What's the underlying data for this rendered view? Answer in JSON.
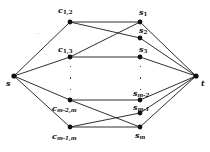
{
  "figure": {
    "background_color": "#ffffff",
    "edge_color": "#1a1a1a",
    "node_color": "#101010",
    "width": 210,
    "height": 152
  },
  "terminals": {
    "source": {
      "label": "s",
      "x": 14,
      "y": 76
    },
    "sink": {
      "label": "t",
      "x": 196,
      "y": 76
    }
  },
  "left_column": {
    "name": "clause-nodes",
    "nodes": [
      {
        "id": "c12",
        "base": "c",
        "subscript": "1,2",
        "x": 70,
        "y": 22,
        "label_x": 58,
        "label_y": 6
      },
      {
        "id": "c13",
        "base": "c",
        "subscript": "1,3",
        "x": 70,
        "y": 57,
        "label_x": 58,
        "label_y": 45
      },
      {
        "id": "cm2m",
        "base": "c",
        "subscript": "m-2,m",
        "x": 70,
        "y": 100,
        "label_x": 52,
        "label_y": 104
      },
      {
        "id": "cm1m",
        "base": "c",
        "subscript": "m-1,m",
        "x": 70,
        "y": 127,
        "label_x": 52,
        "label_y": 132
      }
    ]
  },
  "right_column": {
    "name": "variable-nodes",
    "nodes": [
      {
        "id": "s1",
        "base": "s",
        "subscript": "1",
        "x": 140,
        "y": 22,
        "label_x": 139,
        "label_y": 8
      },
      {
        "id": "s2",
        "base": "s",
        "subscript": "2",
        "x": 140,
        "y": 38,
        "label_x": 139,
        "label_y": 26
      },
      {
        "id": "s3",
        "base": "s",
        "subscript": "3",
        "x": 140,
        "y": 57,
        "label_x": 139,
        "label_y": 45
      },
      {
        "id": "sm2",
        "base": "s",
        "subscript": "m-2",
        "x": 140,
        "y": 100,
        "label_x": 133,
        "label_y": 89
      },
      {
        "id": "sm1",
        "base": "s",
        "subscript": "m-1",
        "x": 140,
        "y": 113,
        "label_x": 133,
        "label_y": 103
      },
      {
        "id": "sm",
        "base": "s",
        "subscript": "m",
        "x": 140,
        "y": 127,
        "label_x": 135,
        "label_y": 131
      }
    ]
  },
  "ellipses": [
    {
      "name": "left-vertical-ellipsis",
      "x": 70,
      "y": 66,
      "height": 24
    },
    {
      "name": "right-vertical-ellipsis",
      "x": 140,
      "y": 66,
      "height": 24
    }
  ],
  "edges": {
    "source_edges": [
      {
        "from": "s",
        "to": "c12"
      },
      {
        "from": "s",
        "to": "c13"
      },
      {
        "from": "s",
        "to": "cm2m"
      },
      {
        "from": "s",
        "to": "cm1m"
      }
    ],
    "middle_edges": [
      {
        "from": "c12",
        "to": "s1"
      },
      {
        "from": "c12",
        "to": "s2"
      },
      {
        "from": "c13",
        "to": "s1"
      },
      {
        "from": "c13",
        "to": "s3"
      },
      {
        "from": "cm2m",
        "to": "sm2"
      },
      {
        "from": "cm2m",
        "to": "sm"
      },
      {
        "from": "cm1m",
        "to": "sm1"
      },
      {
        "from": "cm1m",
        "to": "sm"
      }
    ],
    "sink_edges": [
      {
        "from": "s1",
        "to": "t"
      },
      {
        "from": "s2",
        "to": "t"
      },
      {
        "from": "s3",
        "to": "t"
      },
      {
        "from": "sm2",
        "to": "t"
      },
      {
        "from": "sm1",
        "to": "t"
      },
      {
        "from": "sm",
        "to": "t"
      }
    ]
  },
  "artifact": {
    "name": "scan-smudge",
    "glyph": "¬",
    "x": 34,
    "y": 30
  }
}
